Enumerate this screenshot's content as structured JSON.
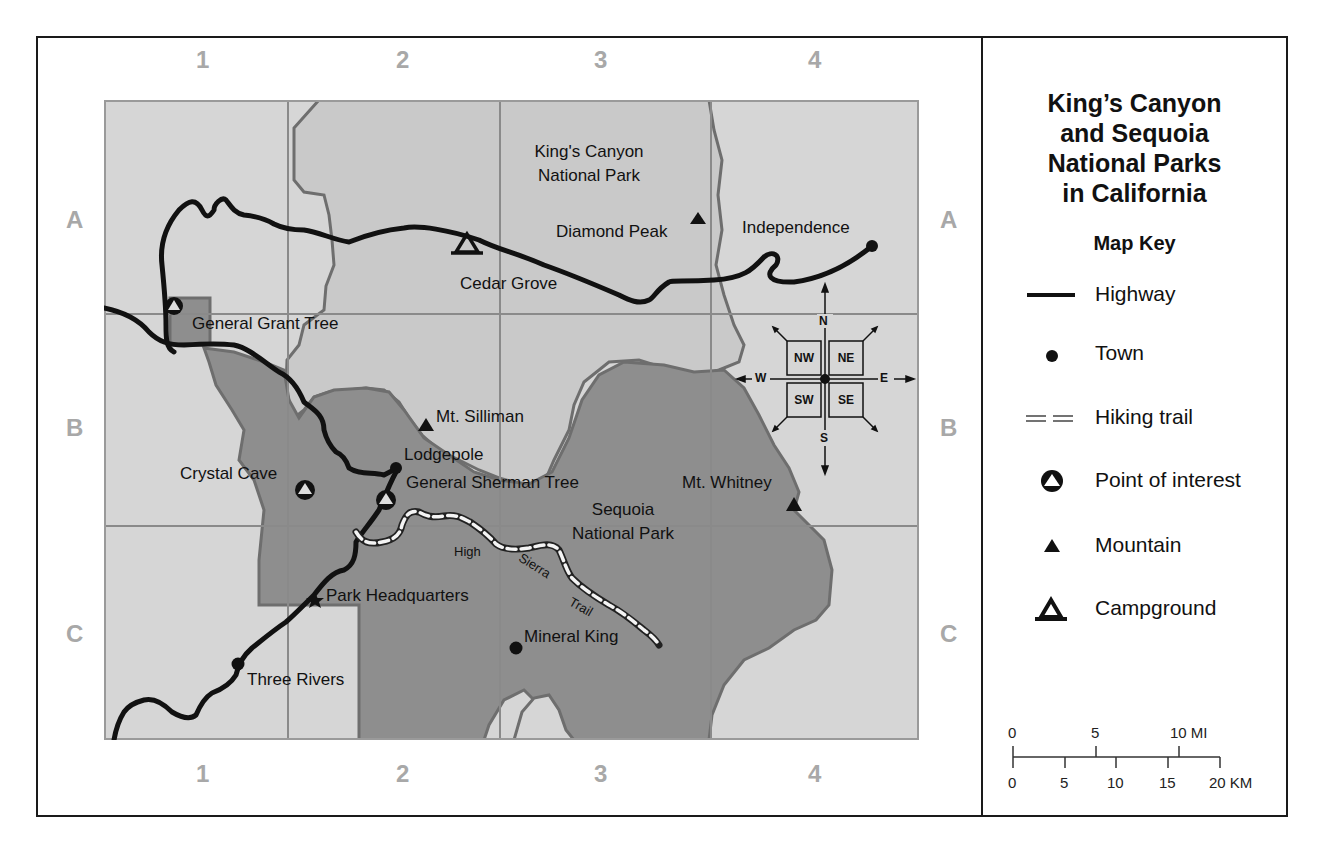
{
  "title": {
    "lines": [
      "King’s Canyon",
      "and Sequoia",
      "National Parks",
      "in California"
    ]
  },
  "map_key": {
    "heading": "Map Key",
    "items": [
      {
        "symbol": "highway-line",
        "label": "Highway"
      },
      {
        "symbol": "town-dot",
        "label": "Town"
      },
      {
        "symbol": "hiking-trail-double-dash",
        "label": "Hiking trail"
      },
      {
        "symbol": "point-of-interest-circle-triangle",
        "label": "Point of interest"
      },
      {
        "symbol": "mountain-triangle",
        "label": "Mountain"
      },
      {
        "symbol": "campground-triangle-outline",
        "label": "Campground"
      }
    ]
  },
  "grid": {
    "columns": [
      "1",
      "2",
      "3",
      "4"
    ],
    "rows": [
      "A",
      "B",
      "C"
    ]
  },
  "scale_bar": {
    "miles": {
      "ticks": [
        "0",
        "5",
        "10 MI"
      ]
    },
    "kilometers": {
      "ticks": [
        "0",
        "5",
        "10",
        "15",
        "20 KM"
      ]
    }
  },
  "compass": {
    "cardinals": {
      "north": "N",
      "south": "S",
      "east": "E",
      "west": "W"
    },
    "intercardinals": {
      "nw": "NW",
      "ne": "NE",
      "sw": "SW",
      "se": "SE"
    }
  },
  "places": {
    "kings_canyon_park": [
      "King's Canyon",
      "National Park"
    ],
    "sequoia_park": [
      "Sequoia",
      "National Park"
    ],
    "towns": {
      "independence": "Independence",
      "lodgepole": "Lodgepole",
      "three_rivers": "Three Rivers",
      "mineral_king": "Mineral King"
    },
    "mountains": {
      "diamond_peak": "Diamond Peak",
      "mt_silliman": "Mt. Silliman",
      "mt_whitney": "Mt. Whitney"
    },
    "points_of_interest": {
      "general_grant_tree": "General Grant Tree",
      "crystal_cave": "Crystal Cave",
      "general_sherman_tree": "General Sherman Tree"
    },
    "campgrounds": {
      "cedar_grove": "Cedar Grove"
    },
    "landmarks": {
      "park_headquarters": "Park Headquarters"
    },
    "trails": {
      "high_sierra_trail": [
        "High",
        "Sierra",
        "Trail"
      ]
    }
  },
  "colors": {
    "outside_park": "#d6d6d6",
    "kings_canyon_fill": "#c9c9c9",
    "sequoia_fill": "#8e8e8e",
    "boundary": "#6e6e6e",
    "highway": "#111111",
    "grid_line": "#8a8a8a",
    "grid_label": "#a8a8a8"
  }
}
